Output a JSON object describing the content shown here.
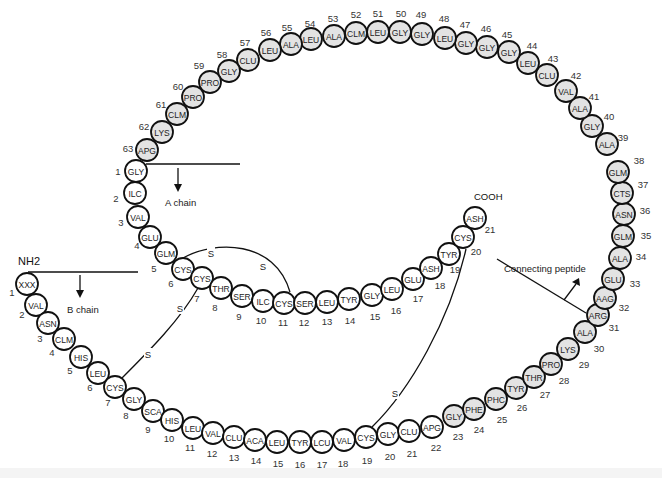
{
  "labels": {
    "nh2": "NH2",
    "cooh": "COOH",
    "a_chain": "A chain",
    "b_chain": "B chain",
    "connecting_peptide": "Connecting peptide",
    "disulfide": "S"
  },
  "colors": {
    "chain_residue_fill": "#ffffff",
    "connecting_residue_fill": "#e3e3e3",
    "stroke": "#111111"
  },
  "b_chain": [
    {
      "n": "1",
      "aa": "XXX",
      "x": 27,
      "y": 284,
      "nx": 12,
      "ny": 292
    },
    {
      "n": "2",
      "aa": "VAL",
      "x": 36,
      "y": 305,
      "nx": 22,
      "ny": 314
    },
    {
      "n": "3",
      "aa": "ASN",
      "x": 48,
      "y": 323,
      "nx": 40,
      "ny": 338
    },
    {
      "n": "4",
      "aa": "CLM",
      "x": 64,
      "y": 339,
      "nx": 52,
      "ny": 352
    },
    {
      "n": "5",
      "aa": "HIS",
      "x": 81,
      "y": 357,
      "nx": 70,
      "ny": 370
    },
    {
      "n": "6",
      "aa": "LEU",
      "x": 98,
      "y": 373,
      "nx": 90,
      "ny": 387
    },
    {
      "n": "7",
      "aa": "CYS",
      "x": 115,
      "y": 387,
      "nx": 108,
      "ny": 402
    },
    {
      "n": "8",
      "aa": "GLY",
      "x": 134,
      "y": 399,
      "nx": 126,
      "ny": 415
    },
    {
      "n": "9",
      "aa": "SCA",
      "x": 153,
      "y": 411,
      "nx": 148,
      "ny": 429
    },
    {
      "n": "10",
      "aa": "HIS",
      "x": 172,
      "y": 420,
      "nx": 169,
      "ny": 438
    },
    {
      "n": "11",
      "aa": "LEU",
      "x": 193,
      "y": 428,
      "nx": 190,
      "ny": 447
    },
    {
      "n": "12",
      "aa": "VAL",
      "x": 213,
      "y": 433,
      "nx": 212,
      "ny": 453
    },
    {
      "n": "13",
      "aa": "CLU",
      "x": 234,
      "y": 437,
      "nx": 234,
      "ny": 457
    },
    {
      "n": "14",
      "aa": "ACA",
      "x": 255,
      "y": 440,
      "nx": 256,
      "ny": 460
    },
    {
      "n": "15",
      "aa": "LEU",
      "x": 277,
      "y": 442,
      "nx": 278,
      "ny": 463
    },
    {
      "n": "16",
      "aa": "TYR",
      "x": 300,
      "y": 442,
      "nx": 300,
      "ny": 464
    },
    {
      "n": "17",
      "aa": "LCU",
      "x": 322,
      "y": 442,
      "nx": 322,
      "ny": 464
    },
    {
      "n": "18",
      "aa": "VAL",
      "x": 344,
      "y": 440,
      "nx": 343,
      "ny": 463
    },
    {
      "n": "19",
      "aa": "CYS",
      "x": 366,
      "y": 437,
      "nx": 367,
      "ny": 460
    },
    {
      "n": "20",
      "aa": "GLY",
      "x": 388,
      "y": 434,
      "nx": 390,
      "ny": 456
    },
    {
      "n": "21",
      "aa": "CLU",
      "x": 409,
      "y": 431,
      "nx": 412,
      "ny": 453
    },
    {
      "n": "22",
      "aa": "APG",
      "x": 432,
      "y": 427,
      "nx": 436,
      "ny": 447
    }
  ],
  "connecting_peptide": [
    {
      "n": "23",
      "aa": "GLY",
      "x": 454,
      "y": 416,
      "nx": 458,
      "ny": 436
    },
    {
      "n": "24",
      "aa": "PHE",
      "x": 474,
      "y": 409,
      "nx": 479,
      "ny": 429
    },
    {
      "n": "25",
      "aa": "PHC",
      "x": 496,
      "y": 399,
      "nx": 502,
      "ny": 419
    },
    {
      "n": "26",
      "aa": "TYR",
      "x": 516,
      "y": 388,
      "nx": 522,
      "ny": 407
    },
    {
      "n": "27",
      "aa": "THR",
      "x": 534,
      "y": 377,
      "nx": 545,
      "ny": 394
    },
    {
      "n": "28",
      "aa": "PRO",
      "x": 551,
      "y": 364,
      "nx": 564,
      "ny": 380
    },
    {
      "n": "29",
      "aa": "LYS",
      "x": 568,
      "y": 349,
      "nx": 584,
      "ny": 364
    },
    {
      "n": "30",
      "aa": "ALA",
      "x": 585,
      "y": 332,
      "nx": 599,
      "ny": 348
    },
    {
      "n": "31",
      "aa": "ARG",
      "x": 598,
      "y": 315,
      "nx": 614,
      "ny": 327
    },
    {
      "n": "32",
      "aa": "AAG",
      "x": 605,
      "y": 298,
      "nx": 624,
      "ny": 307
    },
    {
      "n": "33",
      "aa": "GLU",
      "x": 613,
      "y": 279,
      "nx": 635,
      "ny": 283
    },
    {
      "n": "34",
      "aa": "ALA",
      "x": 620,
      "y": 258,
      "nx": 641,
      "ny": 256
    },
    {
      "n": "35",
      "aa": "GLM",
      "x": 623,
      "y": 236,
      "nx": 646,
      "ny": 235
    },
    {
      "n": "36",
      "aa": "ASN",
      "x": 624,
      "y": 214,
      "nx": 645,
      "ny": 210
    },
    {
      "n": "37",
      "aa": "CTS",
      "x": 622,
      "y": 193,
      "nx": 643,
      "ny": 184
    },
    {
      "n": "38",
      "aa": "GLM",
      "x": 618,
      "y": 172,
      "nx": 639,
      "ny": 160
    },
    {
      "n": "39",
      "aa": "ALA",
      "x": 607,
      "y": 144,
      "nx": 623,
      "ny": 137
    },
    {
      "n": "40",
      "aa": "GLY",
      "x": 592,
      "y": 126,
      "nx": 609,
      "ny": 116
    },
    {
      "n": "41",
      "aa": "ALA",
      "x": 580,
      "y": 108,
      "nx": 594,
      "ny": 96
    },
    {
      "n": "42",
      "aa": "VAL",
      "x": 566,
      "y": 91,
      "nx": 576,
      "ny": 75
    },
    {
      "n": "43",
      "aa": "CLU",
      "x": 547,
      "y": 75,
      "nx": 553,
      "ny": 58
    },
    {
      "n": "44",
      "aa": "LEU",
      "x": 528,
      "y": 63,
      "nx": 532,
      "ny": 45
    },
    {
      "n": "45",
      "aa": "GLY",
      "x": 509,
      "y": 52,
      "nx": 507,
      "ny": 34
    },
    {
      "n": "46",
      "aa": "GLY",
      "x": 487,
      "y": 47,
      "nx": 486,
      "ny": 28
    },
    {
      "n": "47",
      "aa": "GLY",
      "x": 466,
      "y": 43,
      "nx": 465,
      "ny": 24
    },
    {
      "n": "48",
      "aa": "LEU",
      "x": 445,
      "y": 38,
      "nx": 444,
      "ny": 18
    },
    {
      "n": "49",
      "aa": "GLY",
      "x": 422,
      "y": 34,
      "nx": 421,
      "ny": 14
    },
    {
      "n": "50",
      "aa": "GLY",
      "x": 400,
      "y": 32,
      "nx": 401,
      "ny": 13
    },
    {
      "n": "51",
      "aa": "LEU",
      "x": 378,
      "y": 32,
      "nx": 378,
      "ny": 13
    },
    {
      "n": "52",
      "aa": "CLM",
      "x": 356,
      "y": 33,
      "nx": 356,
      "ny": 14
    },
    {
      "n": "53",
      "aa": "ALA",
      "x": 334,
      "y": 36,
      "nx": 333,
      "ny": 18
    },
    {
      "n": "54",
      "aa": "LEU",
      "x": 311,
      "y": 39,
      "nx": 310,
      "ny": 23
    },
    {
      "n": "55",
      "aa": "ALA",
      "x": 291,
      "y": 44,
      "nx": 287,
      "ny": 27
    },
    {
      "n": "56",
      "aa": "LEU",
      "x": 270,
      "y": 50,
      "nx": 266,
      "ny": 32
    },
    {
      "n": "57",
      "aa": "CLU",
      "x": 248,
      "y": 60,
      "nx": 245,
      "ny": 42
    },
    {
      "n": "58",
      "aa": "GLY",
      "x": 229,
      "y": 71,
      "nx": 222,
      "ny": 54
    },
    {
      "n": "59",
      "aa": "PRO",
      "x": 210,
      "y": 82,
      "nx": 199,
      "ny": 65
    },
    {
      "n": "60",
      "aa": "PRO",
      "x": 193,
      "y": 97,
      "nx": 178,
      "ny": 86
    },
    {
      "n": "61",
      "aa": "CLM",
      "x": 177,
      "y": 114,
      "nx": 161,
      "ny": 104
    },
    {
      "n": "62",
      "aa": "LYS",
      "x": 162,
      "y": 132,
      "nx": 144,
      "ny": 126
    },
    {
      "n": "63",
      "aa": "APG",
      "x": 147,
      "y": 150,
      "nx": 128,
      "ny": 148
    }
  ],
  "a_chain": [
    {
      "n": "1",
      "aa": "GLY",
      "x": 136,
      "y": 171,
      "nx": 118,
      "ny": 171
    },
    {
      "n": "2",
      "aa": "ILC",
      "x": 135,
      "y": 193,
      "nx": 116,
      "ny": 198
    },
    {
      "n": "3",
      "aa": "VAL",
      "x": 138,
      "y": 217,
      "nx": 121,
      "ny": 222
    },
    {
      "n": "4",
      "aa": "GLU",
      "x": 150,
      "y": 237,
      "nx": 137,
      "ny": 245
    },
    {
      "n": "5",
      "aa": "GLM",
      "x": 166,
      "y": 253,
      "nx": 154,
      "ny": 268
    },
    {
      "n": "6",
      "aa": "CYS",
      "x": 183,
      "y": 269,
      "nx": 171,
      "ny": 283
    },
    {
      "n": "7",
      "aa": "CYS",
      "x": 202,
      "y": 278,
      "nx": 197,
      "ny": 298
    },
    {
      "n": "8",
      "aa": "THR",
      "x": 221,
      "y": 288,
      "nx": 215,
      "ny": 307
    },
    {
      "n": "9",
      "aa": "SER",
      "x": 242,
      "y": 296,
      "nx": 239,
      "ny": 316
    },
    {
      "n": "10",
      "aa": "ILC",
      "x": 263,
      "y": 301,
      "nx": 261,
      "ny": 320
    },
    {
      "n": "11",
      "aa": "CYS",
      "x": 284,
      "y": 303,
      "nx": 283,
      "ny": 322
    },
    {
      "n": "12",
      "aa": "SER",
      "x": 305,
      "y": 303,
      "nx": 304,
      "ny": 322
    },
    {
      "n": "13",
      "aa": "LEU",
      "x": 327,
      "y": 302,
      "nx": 327,
      "ny": 321
    },
    {
      "n": "14",
      "aa": "TYR",
      "x": 349,
      "y": 299,
      "nx": 350,
      "ny": 320
    },
    {
      "n": "15",
      "aa": "GLY",
      "x": 372,
      "y": 295,
      "nx": 375,
      "ny": 316
    },
    {
      "n": "16",
      "aa": "LEU",
      "x": 392,
      "y": 289,
      "nx": 396,
      "ny": 310
    },
    {
      "n": "17",
      "aa": "GLU",
      "x": 413,
      "y": 279,
      "nx": 418,
      "ny": 298
    },
    {
      "n": "18",
      "aa": "ASH",
      "x": 431,
      "y": 268,
      "nx": 440,
      "ny": 285
    },
    {
      "n": "19",
      "aa": "TYR",
      "x": 449,
      "y": 254,
      "nx": 455,
      "ny": 269
    },
    {
      "n": "20",
      "aa": "CYS",
      "x": 463,
      "y": 237,
      "nx": 476,
      "ny": 251
    },
    {
      "n": "21",
      "aa": "ASH",
      "x": 475,
      "y": 218,
      "nx": 490,
      "ny": 229
    }
  ],
  "disulfide_bonds": [
    {
      "from": "A6",
      "to": "A11",
      "label_positions": [
        [
          211,
          253
        ],
        [
          263,
          266
        ]
      ]
    },
    {
      "from": "A7",
      "to": "B7",
      "label_positions": [
        [
          180,
          308
        ],
        [
          148,
          354
        ]
      ]
    },
    {
      "from": "A20",
      "to": "B19",
      "label_positions": [
        [
          395,
          393
        ]
      ]
    }
  ]
}
